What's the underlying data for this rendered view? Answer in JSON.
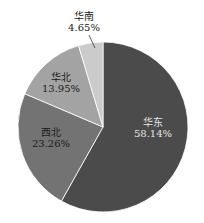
{
  "chart_data": {
    "type": "pie",
    "title": "",
    "start_angle_deg": 0,
    "direction": "clockwise",
    "categories": [
      "华东",
      "西北",
      "华北",
      "华南"
    ],
    "values": [
      58.14,
      23.26,
      13.95,
      4.65
    ],
    "value_labels": [
      "58.14%",
      "23.26%",
      "13.95%",
      "4.65%"
    ],
    "colors": [
      "#4b4b4b",
      "#737373",
      "#a3a3a3",
      "#cbcbcb"
    ],
    "label_colors": [
      "#e8e8e8",
      "#1a1a1a",
      "#1a1a1a",
      "#1a1a1a"
    ],
    "legend": null
  },
  "labels": [
    {
      "name": "华东",
      "pct": "58.14%"
    },
    {
      "name": "西北",
      "pct": "23.26%"
    },
    {
      "name": "华北",
      "pct": "13.95%"
    },
    {
      "name": "华南",
      "pct": "4.65%"
    }
  ]
}
